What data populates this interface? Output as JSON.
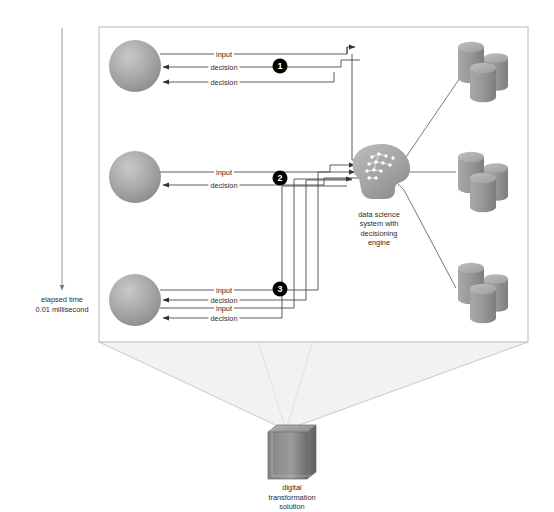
{
  "diagram": {
    "panel": {
      "background": "#ffffff",
      "border_color": "#b5b5b5"
    },
    "colors": {
      "line": "#4a4a4a",
      "badge_fill": "#000000",
      "badge_text": "#ffffff",
      "node_gray_light": "#b9b9b9",
      "node_gray_dark": "#8a8a8a",
      "cube_gray": "#8f8f8f",
      "cone_fill": "#f0f0f0",
      "text": "#2b2b2b"
    },
    "timeline": {
      "label_line1": "elapsed time",
      "label_line2": "0.01 millisecond",
      "arrow_direction": "down"
    },
    "actors": [
      {
        "name": "actor-top",
        "badge": "1",
        "edges": [
          "input",
          "decision",
          "decision"
        ]
      },
      {
        "name": "actor-middle",
        "badge": "2",
        "edges": [
          "input",
          "decision"
        ]
      },
      {
        "name": "actor-bottom",
        "badge": "3",
        "edges": [
          "input",
          "decision",
          "input",
          "decision"
        ]
      }
    ],
    "edge_labels": {
      "input": "input",
      "decision": "decision"
    },
    "badges": [
      "1",
      "2",
      "3"
    ],
    "engine": {
      "name": "data-science-engine",
      "label_line1": "data science",
      "label_line2": "system with",
      "label_line3": "decisioning",
      "label_line4": "engine"
    },
    "datastores": [
      {
        "name": "datastore-top",
        "cylinders": 3
      },
      {
        "name": "datastore-middle",
        "cylinders": 3
      },
      {
        "name": "datastore-bottom",
        "cylinders": 3
      }
    ],
    "solution": {
      "label_line1": "digital",
      "label_line2": "transformation",
      "label_line3": "solution"
    }
  }
}
